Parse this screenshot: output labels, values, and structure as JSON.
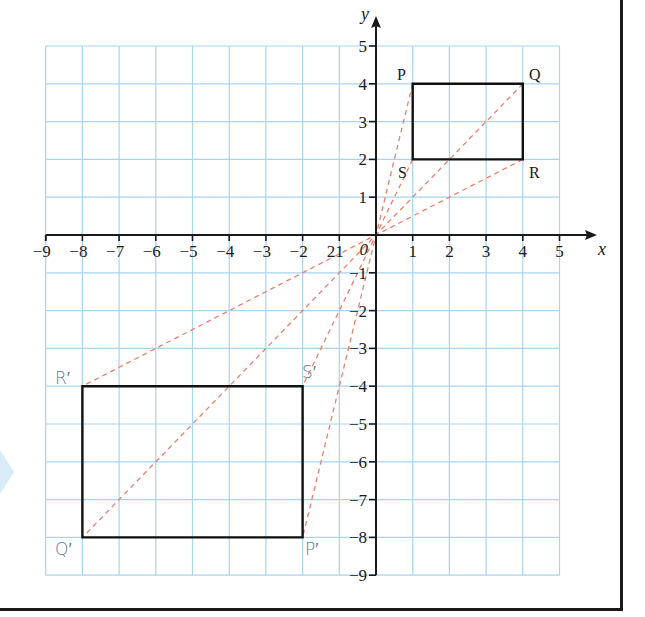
{
  "chart_data": {
    "type": "diagram",
    "title": "",
    "axes": {
      "xlabel": "x",
      "ylabel": "y",
      "xlim": [
        -9,
        5
      ],
      "ylim": [
        -9,
        5
      ],
      "origin_label": "0",
      "x_ticks": [
        -9,
        -8,
        -7,
        -6,
        -5,
        -4,
        -3,
        -2,
        -1,
        1,
        2,
        3,
        4,
        5
      ],
      "x_tick_labels": [
        "−9",
        "−8",
        "−7",
        "−6",
        "−5",
        "−4",
        "−3",
        "−2",
        "21",
        "1",
        "2",
        "3",
        "4",
        "5"
      ],
      "y_ticks": [
        5,
        4,
        3,
        2,
        1,
        -1,
        -2,
        -3,
        -4,
        -5,
        -6,
        -7,
        -8,
        -9
      ],
      "y_tick_labels": [
        "5",
        "4",
        "3",
        "2",
        "1",
        "−1",
        "−2",
        "−3",
        "−4",
        "−5",
        "−6",
        "−7",
        "−8",
        "−9"
      ],
      "grid": true
    },
    "shapes": [
      {
        "name": "PQRS",
        "vertices": [
          {
            "label": "P",
            "x": 1,
            "y": 4
          },
          {
            "label": "Q",
            "x": 4,
            "y": 4
          },
          {
            "label": "R",
            "x": 4,
            "y": 2
          },
          {
            "label": "S",
            "x": 1,
            "y": 2
          }
        ]
      },
      {
        "name": "P'Q'R'S'",
        "vertices": [
          {
            "label": "P′",
            "x": -2,
            "y": -8
          },
          {
            "label": "Q′",
            "x": -8,
            "y": -8
          },
          {
            "label": "R′",
            "x": -8,
            "y": -4
          },
          {
            "label": "S′",
            "x": -2,
            "y": -4
          }
        ]
      }
    ],
    "construction_lines": [
      {
        "from": "P",
        "to": "P′",
        "through": [
          0,
          0
        ]
      },
      {
        "from": "Q",
        "to": "Q′",
        "through": [
          0,
          0
        ]
      },
      {
        "from": "R",
        "to": "R′",
        "through": [
          0,
          0
        ]
      },
      {
        "from": "S",
        "to": "S′",
        "through": [
          0,
          0
        ]
      }
    ],
    "colors": {
      "grid": "#a9d3ef",
      "axes": "#1a1a1a",
      "shape_outline": "#111111",
      "construction": "#e8826c",
      "image_labels": "#5f7694",
      "object_labels": "#1a1a1a"
    }
  },
  "labels": {
    "x_axis": "x",
    "y_axis": "y",
    "origin": "0",
    "P": "P",
    "Q": "Q",
    "R": "R",
    "S": "S",
    "P_img": "P′",
    "Q_img": "Q′",
    "R_img": "R′",
    "S_img": "S′"
  }
}
